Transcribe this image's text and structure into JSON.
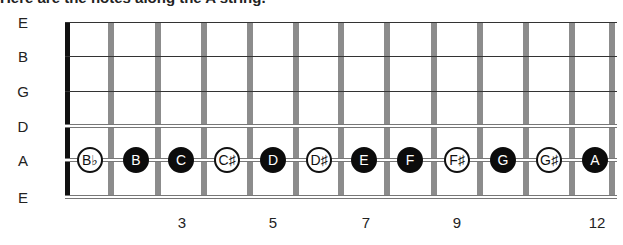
{
  "caption": "Here are the notes along the A string.",
  "strings": [
    {
      "label": "E",
      "y": 22,
      "style": "thin"
    },
    {
      "label": "B",
      "y": 56,
      "style": "thin"
    },
    {
      "label": "G",
      "y": 91,
      "style": "thin"
    },
    {
      "label": "D",
      "y": 126,
      "style": "thick"
    },
    {
      "label": "A",
      "y": 160,
      "style": "thick"
    },
    {
      "label": "E",
      "y": 197,
      "style": "thick"
    }
  ],
  "frets_x": [
    111,
    158,
    204,
    250,
    296,
    341,
    387,
    434,
    480,
    526,
    572,
    612
  ],
  "a_string_notes": [
    {
      "fret": 1,
      "label": "B♭",
      "type": "accidental",
      "x": 90
    },
    {
      "fret": 2,
      "label": "B",
      "type": "natural",
      "x": 136
    },
    {
      "fret": 3,
      "label": "C",
      "type": "natural",
      "x": 181
    },
    {
      "fret": 4,
      "label": "C♯",
      "type": "accidental",
      "x": 227
    },
    {
      "fret": 5,
      "label": "D",
      "type": "natural",
      "x": 273
    },
    {
      "fret": 6,
      "label": "D♯",
      "type": "accidental",
      "x": 319
    },
    {
      "fret": 7,
      "label": "E",
      "type": "natural",
      "x": 364
    },
    {
      "fret": 8,
      "label": "F",
      "type": "natural",
      "x": 410
    },
    {
      "fret": 9,
      "label": "F♯",
      "type": "accidental",
      "x": 457
    },
    {
      "fret": 10,
      "label": "G",
      "type": "natural",
      "x": 503
    },
    {
      "fret": 11,
      "label": "G♯",
      "type": "accidental",
      "x": 549
    },
    {
      "fret": 12,
      "label": "A",
      "type": "natural",
      "x": 595
    }
  ],
  "fret_numbers": [
    {
      "label": "3",
      "x": 182
    },
    {
      "label": "5",
      "x": 273
    },
    {
      "label": "7",
      "x": 366
    },
    {
      "label": "9",
      "x": 457
    },
    {
      "label": "12",
      "x": 597
    }
  ]
}
